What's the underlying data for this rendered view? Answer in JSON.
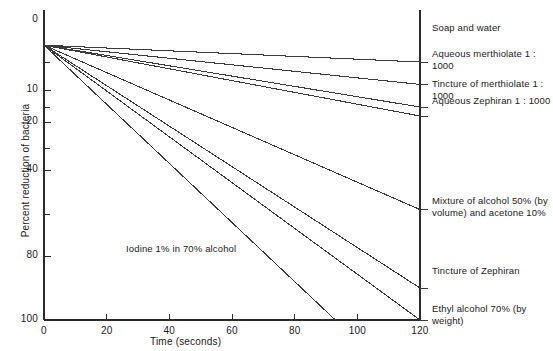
{
  "chart_data": {
    "type": "line",
    "title": "",
    "xlabel": "Time (seconds)",
    "ylabel": "Percent reduction of bacteria",
    "xlim": [
      0,
      120
    ],
    "xticks": [
      0,
      20,
      40,
      60,
      80,
      100,
      120
    ],
    "xtick_labels": [
      "0",
      "20",
      "40",
      "60",
      "80",
      "100",
      "120"
    ],
    "ylim": [
      0,
      100
    ],
    "y_scale": "nonlinear-probability",
    "yticks_labeled": [
      0,
      10,
      20,
      40,
      80,
      100
    ],
    "ytick_labels": [
      "0",
      "10",
      "20",
      "40",
      "80",
      "100"
    ],
    "yticks_minor": [
      5,
      15,
      30,
      60
    ],
    "grid": false,
    "legend": "right-side inline labels",
    "series": [
      {
        "name": "Soap and water",
        "label": "Soap and water",
        "label_pos": "right",
        "points": [
          [
            0,
            3
          ],
          [
            120,
            5
          ]
        ]
      },
      {
        "name": "Aqueous merthiolate 1 : 1000",
        "label": "Aqueous merthiolate 1 : 1000",
        "label_pos": "right",
        "points": [
          [
            0,
            3
          ],
          [
            120,
            9
          ]
        ]
      },
      {
        "name": "Tincture of merthiolate 1 : 1000",
        "label": "Tincture of merthiolate 1 : 1000",
        "label_pos": "right",
        "points": [
          [
            0,
            3
          ],
          [
            120,
            15
          ]
        ]
      },
      {
        "name": "Aqueous Zephiran 1 : 1000",
        "label": "Aqueous Zephiran 1 : 1000",
        "label_pos": "right",
        "points": [
          [
            0,
            3
          ],
          [
            120,
            18
          ]
        ]
      },
      {
        "name": "Mixture of alcohol 50% (by volume) and acetone 10%",
        "label": "Mixture of alcohol 50% (by\nvolume) and acetone 10%",
        "label_pos": "right",
        "points": [
          [
            0,
            3
          ],
          [
            120,
            58
          ]
        ]
      },
      {
        "name": "Tincture of Zephiran",
        "label": "Tincture of Zephiran",
        "label_pos": "right",
        "points": [
          [
            0,
            3
          ],
          [
            120,
            90
          ]
        ]
      },
      {
        "name": "Ethyl alcohol 70% (by weight)",
        "label": "Ethyl alcohol 70% (by weight)",
        "label_pos": "right",
        "points": [
          [
            0,
            3
          ],
          [
            120,
            100
          ]
        ]
      },
      {
        "name": "Iodine 1% in 70% alcohol",
        "label": "Iodine 1% in 70% alcohol",
        "label_pos": "inline",
        "points": [
          [
            0,
            3
          ],
          [
            93,
            100
          ]
        ]
      }
    ]
  },
  "axes": {
    "x_title": "Time (seconds)",
    "y_title": "Percent reduction of bacteria",
    "x_ticks": [
      {
        "value": 0,
        "label": "0"
      },
      {
        "value": 20,
        "label": "20"
      },
      {
        "value": 40,
        "label": "40"
      },
      {
        "value": 60,
        "label": "60"
      },
      {
        "value": 80,
        "label": "80"
      },
      {
        "value": 100,
        "label": "100"
      },
      {
        "value": 120,
        "label": "120"
      }
    ],
    "y_ticks": [
      {
        "value": 0,
        "label": "0",
        "major": true
      },
      {
        "value": 5,
        "label": "",
        "major": false
      },
      {
        "value": 10,
        "label": "10",
        "major": true
      },
      {
        "value": 15,
        "label": "",
        "major": false
      },
      {
        "value": 20,
        "label": "20",
        "major": true
      },
      {
        "value": 30,
        "label": "",
        "major": false
      },
      {
        "value": 40,
        "label": "40",
        "major": true
      },
      {
        "value": 60,
        "label": "",
        "major": false
      },
      {
        "value": 80,
        "label": "80",
        "major": true
      },
      {
        "value": 100,
        "label": "100",
        "major": true
      }
    ]
  },
  "style": {
    "line_color": "#3a3a3a",
    "axis_color": "#2b2b2b",
    "background": "#ffffff"
  }
}
